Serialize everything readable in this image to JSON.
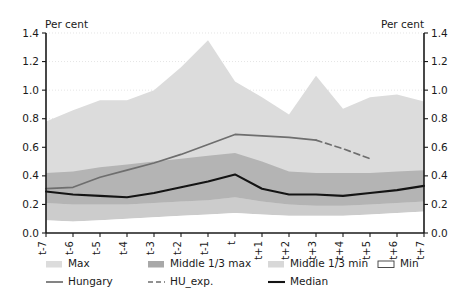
{
  "chart_data": {
    "type": "area",
    "title": "",
    "xlabel": "",
    "ylabel": "Per cent",
    "ylabel_right": "Per cent",
    "ylim": [
      0.0,
      1.4
    ],
    "yticks": [
      "0.0",
      "0.2",
      "0.4",
      "0.6",
      "0.8",
      "1.0",
      "1.2",
      "1.4"
    ],
    "ytick_values": [
      0.0,
      0.2,
      0.4,
      0.6,
      0.8,
      1.0,
      1.2,
      1.4
    ],
    "grid": true,
    "legend_position": "bottom",
    "categories": [
      "t-7",
      "t-6",
      "t-5",
      "t-4",
      "t-3",
      "t-2",
      "t-1",
      "t",
      "t+1",
      "t+2",
      "t+3",
      "t+4",
      "t+5",
      "t+6",
      "t+7"
    ],
    "series": [
      {
        "name": "Max",
        "type": "band-upper",
        "color": "#dcdcdc",
        "values": [
          0.78,
          0.86,
          0.93,
          0.93,
          1.0,
          1.16,
          1.35,
          1.06,
          0.95,
          0.83,
          1.1,
          0.87,
          0.95,
          0.97,
          0.92
        ]
      },
      {
        "name": "Middle 1/3 max",
        "type": "band-upper",
        "color": "#b4b4b4",
        "values": [
          0.42,
          0.43,
          0.46,
          0.48,
          0.5,
          0.52,
          0.54,
          0.56,
          0.5,
          0.43,
          0.42,
          0.42,
          0.42,
          0.43,
          0.44
        ]
      },
      {
        "name": "Middle 1/3 min",
        "type": "band-lower",
        "color": "#cccccc",
        "values": [
          0.21,
          0.2,
          0.2,
          0.2,
          0.21,
          0.22,
          0.23,
          0.25,
          0.22,
          0.2,
          0.19,
          0.19,
          0.2,
          0.21,
          0.22
        ]
      },
      {
        "name": "Min",
        "type": "band-lower",
        "color": "#ffffff",
        "values": [
          0.09,
          0.08,
          0.09,
          0.1,
          0.11,
          0.12,
          0.13,
          0.14,
          0.13,
          0.12,
          0.12,
          0.12,
          0.13,
          0.14,
          0.15
        ]
      },
      {
        "name": "Hungary",
        "type": "line",
        "color": "#6e6e6e",
        "values": [
          0.31,
          0.32,
          0.39,
          0.44,
          0.49,
          0.55,
          0.62,
          0.69,
          0.68,
          0.67,
          0.65,
          null,
          null,
          null,
          null
        ]
      },
      {
        "name": "HU_exp.",
        "type": "line-dashed",
        "color": "#6e6e6e",
        "values": [
          null,
          null,
          null,
          null,
          null,
          null,
          null,
          null,
          null,
          null,
          0.65,
          0.59,
          0.52,
          null,
          null
        ]
      },
      {
        "name": "Median",
        "type": "line",
        "color": "#141414",
        "values": [
          0.29,
          0.27,
          0.26,
          0.25,
          0.28,
          0.32,
          0.36,
          0.41,
          0.31,
          0.27,
          0.27,
          0.26,
          0.28,
          0.3,
          0.33
        ]
      }
    ]
  },
  "legend": {
    "items": [
      {
        "label": "Max",
        "marker": "swatch",
        "color": "#dcdcdc",
        "outlined": false
      },
      {
        "label": "Middle 1/3 max",
        "marker": "swatch",
        "color": "#a8a8a8",
        "outlined": false
      },
      {
        "label": "Middle 1/3 min",
        "marker": "swatch",
        "color": "#d8d8d8",
        "outlined": false
      },
      {
        "label": "Min",
        "marker": "swatch",
        "color": "#ffffff",
        "outlined": true
      },
      {
        "label": "Hungary",
        "marker": "line",
        "color": "#6e6e6e",
        "dashed": false
      },
      {
        "label": "HU_exp.",
        "marker": "line",
        "color": "#6e6e6e",
        "dashed": true
      },
      {
        "label": "Median",
        "marker": "line",
        "color": "#141414",
        "dashed": false
      }
    ]
  }
}
